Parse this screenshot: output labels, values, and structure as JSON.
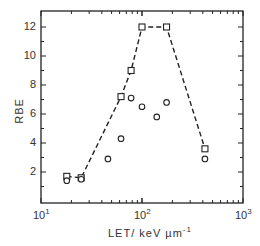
{
  "chart_data": {
    "type": "scatter",
    "title": "",
    "xlabel": "LET / keV µm⁻¹",
    "ylabel": "RBE",
    "xscale": "log",
    "xlim": [
      10,
      1000
    ],
    "ylim": [
      0,
      13
    ],
    "x_ticks": [
      "10¹",
      "10²",
      "10³"
    ],
    "y_ticks": [
      "2",
      "4",
      "6",
      "8",
      "10",
      "12"
    ],
    "grid": false,
    "legend": null,
    "series": [
      {
        "name": "squares (dashed envelope)",
        "marker": "square",
        "line": "dashed",
        "x": [
          18,
          25,
          62,
          78,
          100,
          175,
          420
        ],
        "y": [
          1.7,
          1.6,
          7.2,
          9.0,
          12.0,
          12.0,
          3.6
        ]
      },
      {
        "name": "circles",
        "marker": "circle",
        "line": "none",
        "x": [
          18,
          25,
          46,
          62,
          78,
          100,
          140,
          175,
          420
        ],
        "y": [
          1.4,
          1.5,
          2.9,
          4.3,
          7.1,
          6.5,
          5.8,
          6.8,
          2.9
        ]
      }
    ]
  },
  "axes": {
    "ylabel": "RBE",
    "xlabel_main": "LET/ keV  µm",
    "xlabel_sup": "-1",
    "x_ticks": [
      {
        "base": "10",
        "exp": "1"
      },
      {
        "base": "10",
        "exp": "2"
      },
      {
        "base": "10",
        "exp": "3"
      }
    ],
    "y_ticks": [
      "2",
      "4",
      "6",
      "8",
      "10",
      "12"
    ]
  }
}
